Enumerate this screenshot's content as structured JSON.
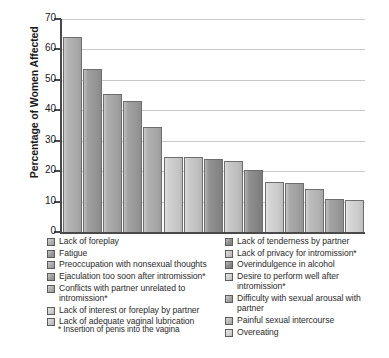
{
  "chart_data": {
    "type": "bar",
    "title": "",
    "xlabel": "",
    "ylabel": "Percentage of Women Affected",
    "ylim": [
      0,
      70
    ],
    "ytick_labels": [
      "70",
      "60",
      "50",
      "40",
      "30",
      "20",
      "10",
      "0"
    ],
    "yticks": [
      70,
      60,
      50,
      40,
      30,
      20,
      10,
      0
    ],
    "grid": "horizontal",
    "legend_position": "below",
    "categories": [
      "Lack of foreplay",
      "Fatigue",
      "Preoccupation with nonsexual thoughts",
      "Ejaculation too soon after intromission*",
      "Conflicts with partner unrelated to intromission*",
      "Lack of interest or foreplay by partner",
      "Lack of adequate vaginal lubrication",
      "Lack of tenderness by partner",
      "Lack of privacy for intromission*",
      "Overindulgence in alcohol",
      "Desire to perform well after intromission*",
      "Difficulty with sexual arousal with partner",
      "Painful sexual intercourse",
      "Overeating",
      "Overeating"
    ],
    "values": [
      64,
      53.5,
      45.5,
      43,
      34.5,
      24.5,
      24.5,
      24,
      23.3,
      20.5,
      16.3,
      16,
      14,
      11,
      10.5
    ],
    "bar_colors": [
      "#b0b0b0",
      "#9a9a9a",
      "#a8a8a8",
      "#9d9d9d",
      "#adadad",
      "#cfcfcf",
      "#c8c8c8",
      "#8d8d8d",
      "#c6c6c6",
      "#8a8a8a",
      "#d2d2d2",
      "#a5a5a5",
      "#b9b9b9",
      "#9e9e9e",
      "#d4d4d4"
    ]
  },
  "legend": {
    "left_column": [
      {
        "label": "Lack of foreplay",
        "color": "#b0b0b0"
      },
      {
        "label": "Fatigue",
        "color": "#9a9a9a"
      },
      {
        "label": "Preoccupation with nonsexual thoughts",
        "color": "#a8a8a8"
      },
      {
        "label": "Ejaculation too soon after intromission*",
        "color": "#9d9d9d"
      },
      {
        "label": "Conflicts with partner unrelated to intromission*",
        "color": "#adadad"
      },
      {
        "label": "Lack of interest or foreplay by partner",
        "color": "#cfcfcf"
      },
      {
        "label": "Lack of adequate vaginal lubrication",
        "color": "#c8c8c8"
      }
    ],
    "right_column": [
      {
        "label": "Lack of tenderness by partner",
        "color": "#8d8d8d"
      },
      {
        "label": "Lack of privacy for intromission*",
        "color": "#c6c6c6"
      },
      {
        "label": "Overindulgence in alcohol",
        "color": "#8a8a8a"
      },
      {
        "label": "Desire to perform well after intromission*",
        "color": "#d2d2d2"
      },
      {
        "label": "Difficulty with sexual arousal with partner",
        "color": "#a5a5a5"
      },
      {
        "label": "Painful sexual intercourse",
        "color": "#b9b9b9"
      },
      {
        "label": "Overeating",
        "color": "#d4d4d4"
      }
    ]
  },
  "footnote": "* Insertion of penis into the vagina"
}
